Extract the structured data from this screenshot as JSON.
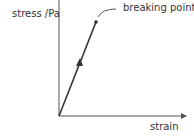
{
  "diagram": {
    "type": "stress-strain graph",
    "y_axis_label": "stress /Pa",
    "x_axis_label": "strain",
    "annotation": "breaking point",
    "line_color": "#333333"
  }
}
